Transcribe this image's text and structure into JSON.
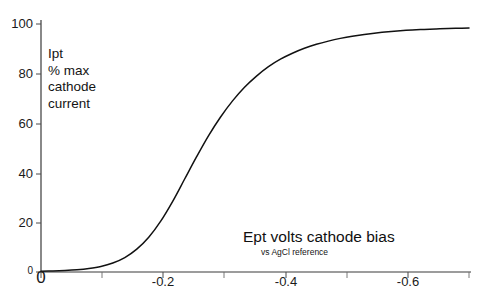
{
  "chart_data": {
    "type": "line",
    "title": "",
    "xlabel": "Ept  volts   cathode bias",
    "xlabel_sub": "vs AgCl reference",
    "ylabel_lines": [
      "Ipt",
      "% max",
      "cathode",
      "current"
    ],
    "xlim": [
      0,
      -0.715
    ],
    "ylim": [
      0,
      100
    ],
    "grid": false,
    "legend": null,
    "x_ticks_major": [
      0,
      -0.2,
      -0.4,
      -0.6
    ],
    "x_tick_labels": [
      "0",
      "-0.2",
      "-0.4",
      "-0.6"
    ],
    "x_ticks_minor": [
      -0.1,
      -0.3,
      -0.5,
      -0.7
    ],
    "y_ticks": [
      0,
      20,
      40,
      60,
      80,
      100
    ],
    "y_tick_labels": [
      "0",
      "20",
      "40",
      "60",
      "80",
      "100"
    ],
    "series": [
      {
        "name": "Ipt cathode current",
        "color": "#111111",
        "x": [
          0.0,
          -0.02,
          -0.04,
          -0.06,
          -0.08,
          -0.1,
          -0.12,
          -0.14,
          -0.16,
          -0.18,
          -0.2,
          -0.22,
          -0.24,
          -0.26,
          -0.28,
          -0.3,
          -0.32,
          -0.34,
          -0.36,
          -0.38,
          -0.4,
          -0.42,
          -0.44,
          -0.46,
          -0.48,
          -0.5,
          -0.52,
          -0.54,
          -0.56,
          -0.58,
          -0.6,
          -0.62,
          -0.64,
          -0.66,
          -0.68,
          -0.7,
          -0.715
        ],
        "y": [
          0.3,
          0.4,
          0.6,
          0.9,
          1.4,
          2.2,
          3.6,
          5.8,
          9.2,
          14.0,
          20.5,
          28.5,
          37.5,
          46.5,
          55.0,
          62.5,
          69.0,
          74.5,
          79.0,
          82.8,
          85.8,
          88.2,
          90.2,
          91.8,
          93.1,
          94.2,
          95.1,
          95.8,
          96.4,
          96.9,
          97.3,
          97.6,
          97.8,
          98.0,
          98.2,
          98.3,
          98.4
        ]
      }
    ]
  },
  "axes": {
    "y_labels": [
      "100",
      "80",
      "60",
      "40",
      "20",
      "0"
    ],
    "x_labels": [
      "0",
      "-0.2",
      "-0.4",
      "-0.6"
    ]
  }
}
